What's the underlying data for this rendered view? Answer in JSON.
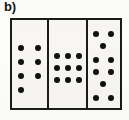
{
  "figure": {
    "label": "b)",
    "type": "dot-pattern-stimulus",
    "border_color": "#1b1b1b",
    "panel_background": "#f7f6f2",
    "dot_color": "#111111",
    "dot_diameter_px": 6
  },
  "chart_data": {
    "type": "scatter",
    "title": "b)",
    "subtitle": "",
    "xlabel": "",
    "ylabel": "",
    "grid": false,
    "legend": null,
    "xlim": [
      0,
      112
    ],
    "ylim": [
      0,
      92
    ],
    "annotations": [
      "b)"
    ],
    "panels": [
      {
        "name": "left-panel",
        "index": 1,
        "dot_count": 7,
        "arrangement": "two columns; three full rows of two dots plus one extra dot in the left column",
        "rows": [
          2,
          2,
          2,
          1
        ],
        "dots": [
          {
            "x": 9,
            "y": 28
          },
          {
            "x": 26,
            "y": 28
          },
          {
            "x": 9,
            "y": 42
          },
          {
            "x": 26,
            "y": 42
          },
          {
            "x": 9,
            "y": 56
          },
          {
            "x": 26,
            "y": 56
          },
          {
            "x": 9,
            "y": 70
          }
        ]
      },
      {
        "name": "middle-panel",
        "index": 2,
        "dot_count": 9,
        "arrangement": "regular three by three square grid",
        "rows": [
          3,
          3,
          3
        ],
        "dots": [
          {
            "x": 8,
            "y": 36
          },
          {
            "x": 19,
            "y": 36
          },
          {
            "x": 30,
            "y": 36
          },
          {
            "x": 8,
            "y": 48
          },
          {
            "x": 19,
            "y": 48
          },
          {
            "x": 30,
            "y": 48
          },
          {
            "x": 8,
            "y": 60
          },
          {
            "x": 19,
            "y": 60
          },
          {
            "x": 30,
            "y": 60
          }
        ]
      },
      {
        "name": "right-panel",
        "index": 3,
        "dot_count": 10,
        "arrangement": "six rows alternating pairs and single centred dots",
        "rows": [
          2,
          1,
          2,
          2,
          1,
          2
        ],
        "dots": [
          {
            "x": 8,
            "y": 14
          },
          {
            "x": 23,
            "y": 14
          },
          {
            "x": 15,
            "y": 26
          },
          {
            "x": 8,
            "y": 40
          },
          {
            "x": 23,
            "y": 40
          },
          {
            "x": 8,
            "y": 52
          },
          {
            "x": 23,
            "y": 52
          },
          {
            "x": 15,
            "y": 64
          },
          {
            "x": 8,
            "y": 78
          },
          {
            "x": 23,
            "y": 78
          }
        ]
      }
    ]
  }
}
